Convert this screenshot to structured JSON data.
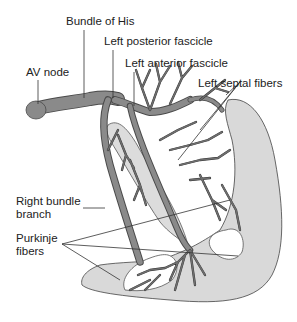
{
  "diagram": {
    "labels": {
      "av_node": "AV node",
      "bundle_of_his": "Bundle of His",
      "left_posterior_fascicle": "Left posterior fascicle",
      "left_anterior_fascicle": "Left anterior fascicle",
      "left_septal_fibers": "Left septal fibers",
      "right_bundle_branch_line1": "Right bundle",
      "right_bundle_branch_line2": "branch",
      "purkinje_fibers_line1": "Purkinje",
      "purkinje_fibers_line2": "fibers"
    },
    "colors": {
      "background": "#ffffff",
      "myocardium_wall": "#d9d9d9",
      "conduction_tissue": "#8a8a8a",
      "outline": "#444444",
      "text": "#222222"
    }
  }
}
